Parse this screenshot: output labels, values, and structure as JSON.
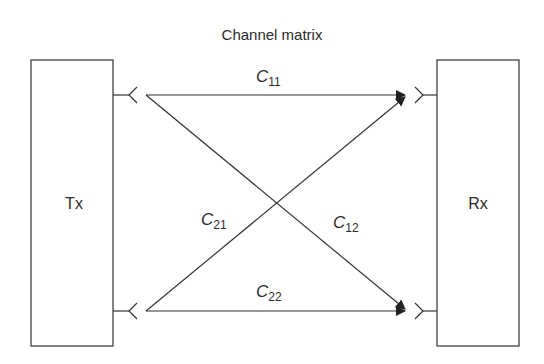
{
  "title": "Channel matrix",
  "transmitter": {
    "label": "Tx"
  },
  "receiver": {
    "label": "Rx"
  },
  "coefficients": [
    {
      "id": "C11",
      "symbol": "C",
      "subscript": "11",
      "from": "Tx antenna 1",
      "to": "Rx antenna 1"
    },
    {
      "id": "C21",
      "symbol": "C",
      "subscript": "21",
      "from": "Tx antenna 2",
      "to": "Rx antenna 1"
    },
    {
      "id": "C12",
      "symbol": "C",
      "subscript": "12",
      "from": "Tx antenna 1",
      "to": "Rx antenna 2"
    },
    {
      "id": "C22",
      "symbol": "C",
      "subscript": "22",
      "from": "Tx antenna 2",
      "to": "Rx antenna 2"
    }
  ],
  "colors": {
    "line": "#333333",
    "text": "#2b2b2b",
    "background": "#ffffff"
  }
}
